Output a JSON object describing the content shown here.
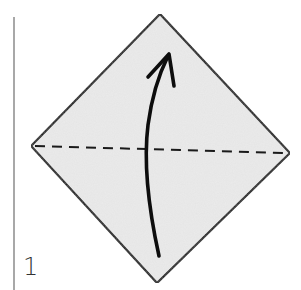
{
  "step": {
    "number": "1"
  },
  "diagram": {
    "kind": "origami-fold-step",
    "paper_color": "#ebebeb",
    "outline_color": "#111111",
    "fold_line": "valley-fold (dashed, horizontal diagonal)",
    "arrow": "fold bottom half up"
  }
}
